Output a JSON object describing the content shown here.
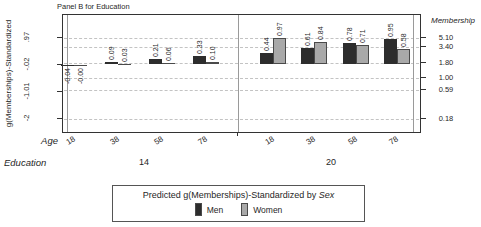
{
  "panel_title": "Panel B for Education",
  "axes": {
    "left_label": "g(Memberships)-Standardized",
    "right_label": "Membership",
    "age_label": "Age",
    "education_label": "Education"
  },
  "chart_data": {
    "type": "bar",
    "title": "Panel B for Education",
    "ylabel": "g(Memberships)-Standardized",
    "y2label": "Membership",
    "xlabel": "Age",
    "group_label": "Education",
    "ylim": [
      -2.55,
      1.8
    ],
    "grid": "horizontal dashed",
    "legend_position": "bottom",
    "left_ticks": [
      ".97",
      "-.02",
      "-1.01",
      "-2"
    ],
    "right_ticks": [
      "5.10",
      "3.40",
      "1.80",
      "1.00",
      "0.59",
      "0.18"
    ],
    "groups": [
      {
        "education": "14",
        "categories": [
          "18",
          "38",
          "58",
          "78"
        ],
        "series": [
          {
            "name": "Men",
            "values": [
              -0.04,
              0.09,
              0.21,
              0.33
            ],
            "labels": [
              "-0.04",
              "0.09",
              "0.21",
              "0.33"
            ]
          },
          {
            "name": "Women",
            "values": [
              0.0,
              0.03,
              0.06,
              0.1
            ],
            "labels": [
              "-0.00",
              "0.03",
              "0.06",
              "0.10"
            ]
          }
        ]
      },
      {
        "education": "20",
        "categories": [
          "18",
          "38",
          "58",
          "78"
        ],
        "series": [
          {
            "name": "Men",
            "values": [
              0.44,
              0.61,
              0.78,
              0.95
            ],
            "labels": [
              "0.44",
              "0.61",
              "0.78",
              "0.95"
            ]
          },
          {
            "name": "Women",
            "values": [
              0.97,
              0.84,
              0.71,
              0.58
            ],
            "labels": [
              "0.97",
              "0.84",
              "0.71",
              "0.58"
            ]
          }
        ]
      }
    ]
  },
  "legend": {
    "title_prefix": "Predicted g(Memberships)-Standardized by ",
    "title_italic": "Sex",
    "entries": [
      {
        "label": "Men",
        "color": "#2d2d2d"
      },
      {
        "label": "Women",
        "color": "#a9a9a9"
      }
    ]
  },
  "colors": {
    "men": "#2d2d2d",
    "women": "#a9a9a9",
    "grid": "#c3c3c3",
    "frame": "#333333",
    "text": "#1f1f1f",
    "background": "#ffffff"
  }
}
